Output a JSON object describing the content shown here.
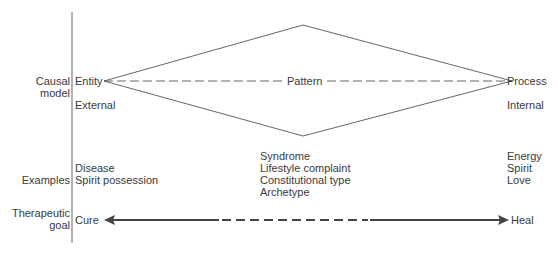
{
  "row_labels": {
    "causal_model": [
      "Causal",
      "model"
    ],
    "examples": "Examples",
    "therapeutic_goal": [
      "Therapeutic",
      "goal"
    ]
  },
  "causal_model": {
    "left_pole": "Entity",
    "center": "Pattern",
    "right_pole": "Process",
    "left_locus": "External",
    "right_locus": "Internal"
  },
  "examples": {
    "left": [
      "Disease",
      "Spirit possession"
    ],
    "center": [
      "Syndrome",
      "Lifestyle complaint",
      "Constitutional type",
      "Archetype"
    ],
    "right": [
      "Energy",
      "Spirit",
      "Love"
    ]
  },
  "therapeutic_goal": {
    "left": "Cure",
    "right": "Heal"
  },
  "colors": {
    "line": "#555555",
    "arrow": "#444444",
    "text": "#3a3a3a"
  }
}
